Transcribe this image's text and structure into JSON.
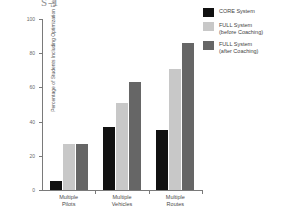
{
  "figure": {
    "scan_artifact_text": "S-1",
    "background_color": "#ffffff"
  },
  "chart_data": {
    "type": "bar",
    "title": "",
    "xlabel": "",
    "ylabel": "Percentage of Students Including\nOptimization Elements",
    "categories": [
      "Multiple\nPilots",
      "Multiple\nVehicles",
      "Multiple\nRoutes"
    ],
    "category_labels_flat": [
      "Multiple Pilots",
      "Multiple Vehicles",
      "Multiple Routes"
    ],
    "series": [
      {
        "name": "CORE System",
        "color": "#111111",
        "values": [
          5,
          37,
          35
        ]
      },
      {
        "name": "FULL System\n(before Coaching)",
        "color": "#c8c8c8",
        "values": [
          27,
          51,
          71
        ]
      },
      {
        "name": "FULL System\n(after Coaching)",
        "color": "#666666",
        "values": [
          27,
          63,
          86
        ]
      }
    ],
    "ylim": [
      0,
      100
    ],
    "yticks": [
      0,
      20,
      40,
      60,
      80,
      100
    ],
    "ytick_labels": [
      "0",
      "20",
      "40",
      "60",
      "80",
      "100"
    ],
    "grid": false,
    "legend_position": "right-top",
    "axis_color": "#7a7a7a"
  }
}
